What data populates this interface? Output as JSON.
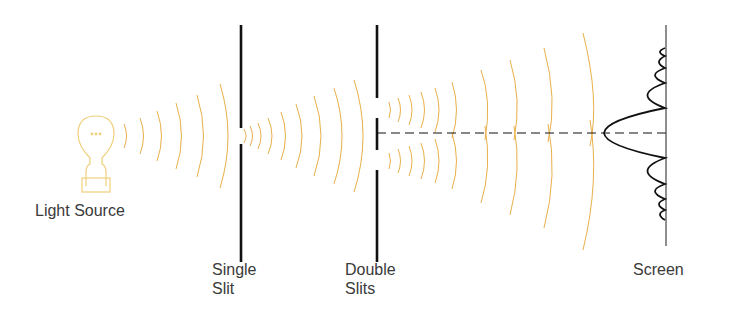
{
  "labels": {
    "light_source": "Light Source",
    "single_slit_line1": "Single",
    "single_slit_line2": "Slit",
    "double_slits_line1": "Double",
    "double_slits_line2": "Slits",
    "screen": "Screen"
  },
  "colors": {
    "wave": "#e8b04a",
    "bulb": "#efcf7a",
    "barrier": "#111111",
    "text": "#3a3a3a"
  },
  "icons": {
    "light_source": "lightbulb-icon"
  }
}
